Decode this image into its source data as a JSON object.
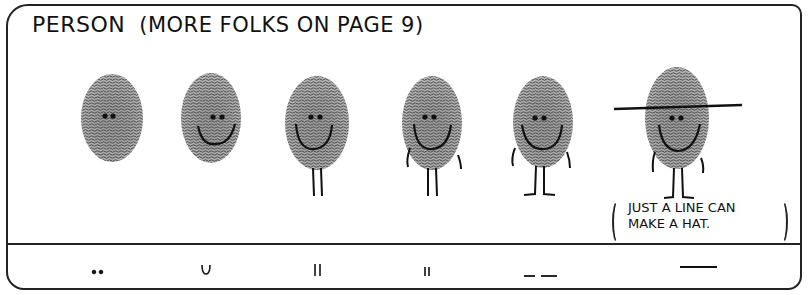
{
  "title": {
    "main": "PERSON",
    "sub": "(MORE FOLKS ON PAGE 9)"
  },
  "figures": [
    {
      "label": "eyes only",
      "x": 112,
      "features": [
        "eyes"
      ]
    },
    {
      "label": "eyes and smile",
      "x": 211,
      "features": [
        "eyes",
        "smile"
      ]
    },
    {
      "label": "smile and legs",
      "x": 317,
      "features": [
        "eyes",
        "smile",
        "legs"
      ]
    },
    {
      "label": "smile, legs and arms",
      "x": 432,
      "features": [
        "eyes",
        "smile",
        "legs",
        "arms"
      ]
    },
    {
      "label": "smile, arms, legs and feet",
      "x": 543,
      "features": [
        "eyes",
        "smile",
        "legs",
        "arms",
        "feet"
      ]
    },
    {
      "label": "with hat",
      "x": 677,
      "features": [
        "eyes",
        "smile",
        "legs",
        "arms",
        "feet",
        "hat"
      ]
    }
  ],
  "note": {
    "line1": "JUST A LINE CAN",
    "line2": "MAKE A HAT."
  },
  "key_strokes": [
    {
      "symbol": "dots",
      "x": 98
    },
    {
      "symbol": "u-curve",
      "x": 205
    },
    {
      "symbol": "double-line-tall",
      "x": 317
    },
    {
      "symbol": "double-line-short",
      "x": 427
    },
    {
      "symbol": "dashes",
      "x": 540
    },
    {
      "symbol": "long-line",
      "x": 700
    }
  ],
  "colors": {
    "ink": "#222222",
    "paper": "#ffffff",
    "print": "#7a7a7a"
  }
}
